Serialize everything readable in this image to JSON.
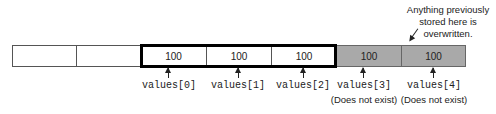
{
  "diagram": {
    "callout": "Anything previously stored here is overwritten.",
    "cells": [
      {
        "value": "",
        "state": "empty"
      },
      {
        "value": "",
        "state": "empty"
      },
      {
        "value": "100",
        "state": "in-array"
      },
      {
        "value": "100",
        "state": "in-array"
      },
      {
        "value": "100",
        "state": "in-array"
      },
      {
        "value": "100",
        "state": "out-of-bounds"
      },
      {
        "value": "100",
        "state": "out-of-bounds"
      }
    ],
    "labels": [
      {
        "text": "values[0]",
        "note": ""
      },
      {
        "text": "values[1]",
        "note": ""
      },
      {
        "text": "values[2]",
        "note": ""
      },
      {
        "text": "values[3]",
        "note": "(Does not exist)"
      },
      {
        "text": "values[4]",
        "note": "(Does not exist)"
      }
    ],
    "colors": {
      "in_array_border": "#000000",
      "out_of_bounds_fill": "#a9a9a9"
    }
  }
}
